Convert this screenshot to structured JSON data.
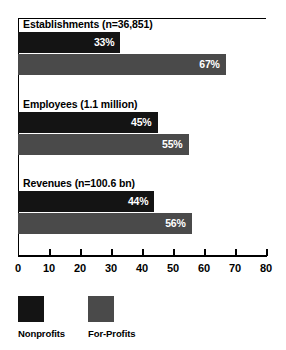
{
  "chart_data": {
    "type": "bar",
    "orientation": "horizontal",
    "title": "",
    "xlabel": "",
    "ylabel": "",
    "xlim": [
      0,
      80
    ],
    "xticks": [
      0,
      10,
      20,
      30,
      40,
      50,
      60,
      70,
      80
    ],
    "xtick_labels": [
      "0",
      "10",
      "20",
      "30",
      "40",
      "50",
      "60",
      "70",
      "80"
    ],
    "grid": false,
    "legend_position": "bottom-left",
    "categories": [
      "Establishments  (n=36,851)",
      "Employees  (1.1 million)",
      "Revenues  (n=100.6 bn)"
    ],
    "series": [
      {
        "name": "Nonprofits",
        "color": "#141414",
        "values": [
          33,
          45,
          44
        ],
        "value_labels": [
          "33%",
          "45%",
          "56%"
        ]
      },
      {
        "name": "For-Profits",
        "color": "#4a4a4a",
        "values": [
          67,
          55,
          56
        ],
        "value_labels": [
          "67%",
          "55%",
          "56%"
        ]
      }
    ],
    "groups": [
      {
        "label": "Establishments  (n=36,851)",
        "bars": [
          {
            "series": "Nonprofits",
            "value": 33,
            "label": "33%"
          },
          {
            "series": "For-Profits",
            "value": 67,
            "label": "67%"
          }
        ]
      },
      {
        "label": "Employees  (1.1 million)",
        "bars": [
          {
            "series": "Nonprofits",
            "value": 45,
            "label": "45%"
          },
          {
            "series": "For-Profits",
            "value": 55,
            "label": "55%"
          }
        ]
      },
      {
        "label": "Revenues  (n=100.6 bn)",
        "bars": [
          {
            "series": "Nonprofits",
            "value": 44,
            "label": "44%"
          },
          {
            "series": "For-Profits",
            "value": 56,
            "label": "56%"
          }
        ]
      }
    ]
  },
  "legend": {
    "items": [
      {
        "label": "Nonprofits",
        "color": "#141414"
      },
      {
        "label": "For-Profits",
        "color": "#4a4a4a"
      }
    ]
  }
}
